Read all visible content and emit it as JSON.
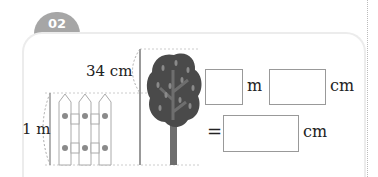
{
  "problem": {
    "number": "02",
    "tree_height_label": "34 cm",
    "fence_height_label": "1 m"
  },
  "answer": {
    "row1": {
      "box1_value": "",
      "unit1": "m",
      "box2_value": "",
      "unit2": "cm"
    },
    "row2": {
      "equals": "=",
      "box_value": "",
      "unit": "cm"
    }
  },
  "colors": {
    "tab": "#a6a6a6",
    "tree_crown": "#4a4a4a",
    "trunk": "#6e6e6e",
    "fence_dot": "#8a8a8a"
  }
}
